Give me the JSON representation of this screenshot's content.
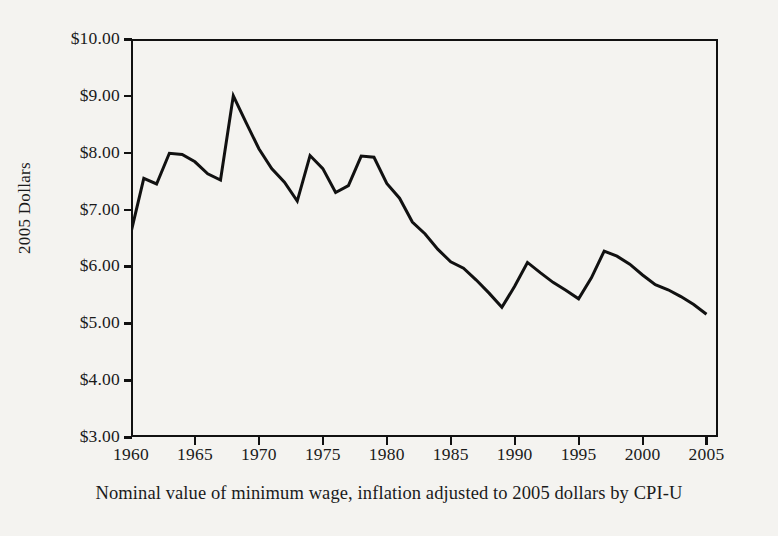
{
  "chart_data": {
    "type": "line",
    "title": "",
    "subtitle": "",
    "caption": "Nominal value of minimum wage, inflation adjusted to 2005 dollars by CPI-U",
    "source": "DEPT. OF LABOR; CONGRESSIONAL BUDGET OFFICE",
    "xlabel": "",
    "ylabel": "2005 Dollars",
    "xlim": [
      1960,
      2005.9
    ],
    "ylim": [
      3.0,
      10.0
    ],
    "grid": false,
    "legend": null,
    "y_tick_labels": [
      "$10.00",
      "$9.00",
      "$8.00",
      "$7.00",
      "$6.00",
      "$5.00",
      "$4.00",
      "$3.00"
    ],
    "y_tick_values": [
      10.0,
      9.0,
      8.0,
      7.0,
      6.0,
      5.0,
      4.0,
      3.0
    ],
    "x_tick_labels": [
      "1960",
      "1965",
      "1970",
      "1975",
      "1980",
      "1985",
      "1990",
      "1995",
      "2000",
      "2005"
    ],
    "x_tick_values": [
      1960,
      1965,
      1970,
      1975,
      1980,
      1985,
      1990,
      1995,
      2000,
      2005
    ],
    "line_color": "#111111",
    "x": [
      1960,
      1961,
      1962,
      1963,
      1964,
      1965,
      1966,
      1967,
      1968,
      1969,
      1970,
      1971,
      1972,
      1973,
      1974,
      1975,
      1976,
      1977,
      1978,
      1979,
      1980,
      1981,
      1982,
      1983,
      1984,
      1985,
      1986,
      1987,
      1988,
      1989,
      1990,
      1991,
      1992,
      1993,
      1994,
      1995,
      1996,
      1997,
      1998,
      1999,
      2000,
      2001,
      2002,
      2003,
      2004,
      2005
    ],
    "values": [
      6.6,
      7.55,
      7.45,
      7.99,
      7.97,
      7.84,
      7.63,
      7.52,
      9.0,
      8.53,
      8.07,
      7.72,
      7.48,
      7.15,
      7.95,
      7.72,
      7.3,
      7.42,
      7.94,
      7.92,
      7.46,
      7.2,
      6.78,
      6.57,
      6.3,
      6.08,
      5.97,
      5.76,
      5.53,
      5.28,
      5.65,
      6.07,
      5.89,
      5.72,
      5.58,
      5.43,
      5.8,
      6.27,
      6.18,
      6.04,
      5.85,
      5.68,
      5.59,
      5.47,
      5.33,
      5.16
    ]
  },
  "axes": {
    "y_title": "2005 Dollars"
  }
}
